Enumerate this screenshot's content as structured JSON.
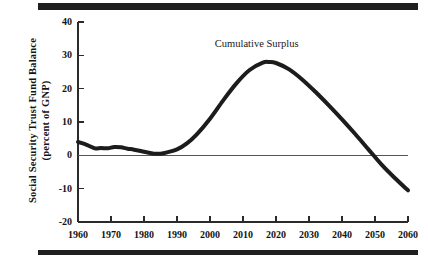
{
  "chart_data": {
    "type": "line",
    "title": "",
    "xlabel": "",
    "ylabel": "Social Security Trust Fund Balance (percent of GNP)",
    "ylabel_line1": "Social Security Trust Fund Balance",
    "ylabel_line2": "(percent of GNP)",
    "xlim": [
      1960,
      2060
    ],
    "ylim": [
      -20,
      40
    ],
    "xticks": [
      1960,
      1970,
      1980,
      1990,
      2000,
      2010,
      2020,
      2030,
      2040,
      2050,
      2060
    ],
    "yticks": [
      40,
      30,
      20,
      10,
      0,
      -10,
      -20
    ],
    "xtick_labels": [
      "1960",
      "1970",
      "1980",
      "1990",
      "2000",
      "2010",
      "2020",
      "2030",
      "2040",
      "2050",
      "2060"
    ],
    "ytick_labels": [
      "40",
      "30",
      "20",
      "10",
      "0",
      "-10",
      "-20"
    ],
    "grid": false,
    "zero_line": true,
    "legend_position": "inline-annotation",
    "series": [
      {
        "name": "Cumulative Surplus",
        "annotation": "Cumulative Surplus",
        "annotation_x": 2016,
        "annotation_y": 33,
        "color": "#1c1c1c",
        "line_width": 4,
        "x": [
          1960,
          1963,
          1965,
          1967,
          1969,
          1971,
          1973,
          1975,
          1977,
          1980,
          1983,
          1985,
          1987,
          1990,
          1993,
          1996,
          2000,
          2004,
          2008,
          2012,
          2016,
          2018,
          2020,
          2024,
          2028,
          2032,
          2036,
          2040,
          2044,
          2048,
          2052,
          2056,
          2060
        ],
        "y": [
          4.0,
          3.0,
          2.1,
          2.2,
          2.1,
          2.5,
          2.4,
          2.0,
          1.7,
          1.1,
          0.5,
          0.5,
          0.9,
          1.8,
          3.6,
          6.3,
          11.0,
          16.5,
          21.6,
          25.6,
          27.8,
          28.0,
          27.7,
          25.8,
          22.7,
          19.0,
          15.0,
          10.8,
          6.4,
          1.8,
          -2.8,
          -6.8,
          -10.5
        ]
      }
    ]
  },
  "frame": {
    "rule_color": "#1f1f1f",
    "background": "#ffffff",
    "axis_color": "#2a2a2a",
    "zero_line_color": "#555555"
  }
}
